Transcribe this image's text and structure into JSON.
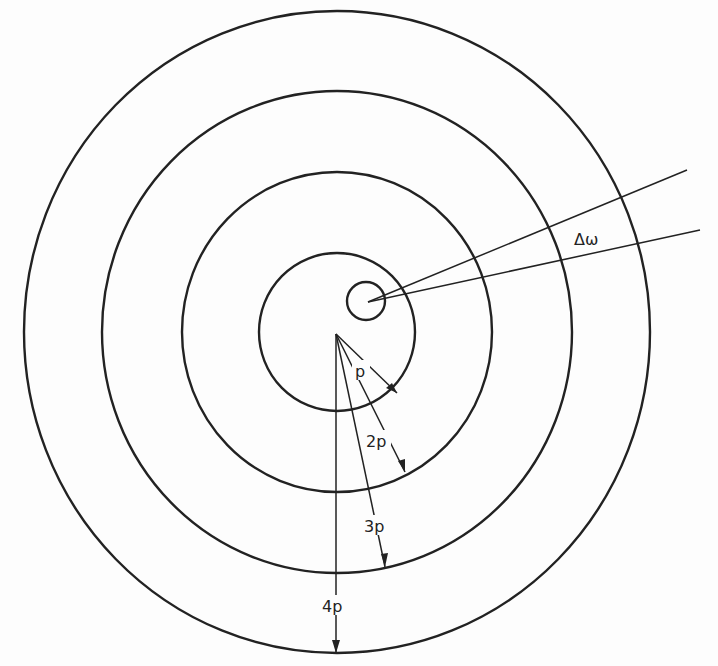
{
  "diagram": {
    "labels": {
      "p": "p",
      "p2": "2p",
      "p3": "3p",
      "p4": "4p",
      "delta_omega": "Δω"
    },
    "circles": [
      {
        "name": "ring-1",
        "label": "p"
      },
      {
        "name": "ring-2",
        "label": "2p"
      },
      {
        "name": "ring-3",
        "label": "3p"
      },
      {
        "name": "ring-4",
        "label": "4p"
      }
    ],
    "line_color": "#222222",
    "background": "#fdfdfd"
  }
}
